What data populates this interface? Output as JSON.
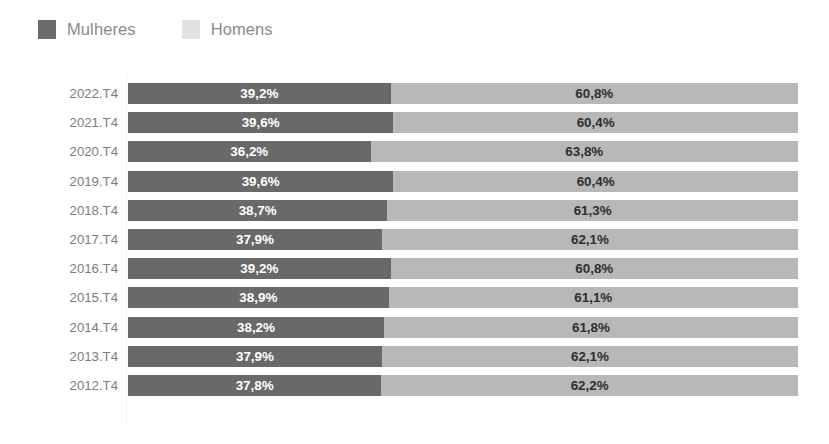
{
  "legend": {
    "items": [
      {
        "label": "Mulheres",
        "color": "#696969",
        "swatch_color": "#6b6b6b",
        "icon": "legend-swatch-icon"
      },
      {
        "label": "Homens",
        "color": "#b8b8b8",
        "swatch_color": "#e2e2e2",
        "icon": "legend-swatch-icon"
      }
    ]
  },
  "chart_data": {
    "type": "bar",
    "orientation": "horizontal",
    "stacked": true,
    "stack_total": 100,
    "title": "",
    "subtitle": "",
    "xlabel": "",
    "ylabel": "",
    "xlim": [
      0,
      100
    ],
    "grid": false,
    "legend_position": "top-left",
    "value_unit": "%",
    "decimal_separator": ",",
    "categories": [
      "2022.T4",
      "2021.T4",
      "2020.T4",
      "2019.T4",
      "2018.T4",
      "2017.T4",
      "2016.T4",
      "2015.T4",
      "2014.T4",
      "2013.T4",
      "2012.T4"
    ],
    "series": [
      {
        "name": "Mulheres",
        "color": "#696969",
        "values": [
          39.2,
          39.6,
          36.2,
          39.6,
          38.7,
          37.9,
          39.2,
          38.9,
          38.2,
          37.9,
          37.8
        ],
        "labels": [
          "39,2%",
          "39,6%",
          "36,2%",
          "39,6%",
          "38,7%",
          "37,9%",
          "39,2%",
          "38,9%",
          "38,2%",
          "37,9%",
          "37,8%"
        ]
      },
      {
        "name": "Homens",
        "color": "#b8b8b8",
        "values": [
          60.8,
          60.4,
          63.8,
          60.4,
          61.3,
          62.1,
          60.8,
          61.1,
          61.8,
          62.1,
          62.2
        ],
        "labels": [
          "60,8%",
          "60,4%",
          "63,8%",
          "60,4%",
          "61,3%",
          "62,1%",
          "60,8%",
          "61,1%",
          "61,8%",
          "62,1%",
          "62,2%"
        ]
      }
    ],
    "rows": [
      {
        "category": "2022.T4",
        "women_value": 39.2,
        "women_label": "39,2%",
        "men_value": 60.8,
        "men_label": "60,8%"
      },
      {
        "category": "2021.T4",
        "women_value": 39.6,
        "women_label": "39,6%",
        "men_value": 60.4,
        "men_label": "60,4%"
      },
      {
        "category": "2020.T4",
        "women_value": 36.2,
        "women_label": "36,2%",
        "men_value": 63.8,
        "men_label": "63,8%"
      },
      {
        "category": "2019.T4",
        "women_value": 39.6,
        "women_label": "39,6%",
        "men_value": 60.4,
        "men_label": "60,4%"
      },
      {
        "category": "2018.T4",
        "women_value": 38.7,
        "women_label": "38,7%",
        "men_value": 61.3,
        "men_label": "61,3%"
      },
      {
        "category": "2017.T4",
        "women_value": 37.9,
        "women_label": "37,9%",
        "men_value": 62.1,
        "men_label": "62,1%"
      },
      {
        "category": "2016.T4",
        "women_value": 39.2,
        "women_label": "39,2%",
        "men_value": 60.8,
        "men_label": "60,8%"
      },
      {
        "category": "2015.T4",
        "women_value": 38.9,
        "women_label": "38,9%",
        "men_value": 61.1,
        "men_label": "61,1%"
      },
      {
        "category": "2014.T4",
        "women_value": 38.2,
        "women_label": "38,2%",
        "men_value": 61.8,
        "men_label": "61,8%"
      },
      {
        "category": "2013.T4",
        "women_value": 37.9,
        "women_label": "37,9%",
        "men_value": 62.1,
        "men_label": "62,1%"
      },
      {
        "category": "2012.T4",
        "women_value": 37.8,
        "women_label": "37,8%",
        "men_value": 62.2,
        "men_label": "62,2%"
      }
    ]
  }
}
